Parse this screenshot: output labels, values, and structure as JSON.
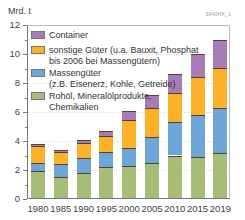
{
  "chart_data": {
    "type": "bar",
    "stacked": true,
    "title": "",
    "xlabel": "",
    "ylabel": "Mrd. t",
    "ylim": [
      0,
      12
    ],
    "yticks": [
      0,
      2,
      4,
      6,
      8,
      10,
      12
    ],
    "categories": [
      "1980",
      "1985",
      "1990",
      "1995",
      "2000",
      "2005",
      "2010",
      "2015",
      "2019"
    ],
    "series": [
      {
        "name": "Rohöl, Mineralölprodukte, Chemikalien",
        "color": "#a6bd78",
        "values": [
          1.9,
          1.5,
          1.8,
          2.2,
          2.25,
          2.5,
          3.0,
          2.9,
          3.15
        ]
      },
      {
        "name": "Massengüter (z.B. Eisenerz, Kohle, Getreide)",
        "color": "#6fa6d8",
        "values": [
          0.55,
          0.9,
          1.0,
          1.05,
          1.3,
          1.75,
          2.3,
          2.9,
          3.15
        ]
      },
      {
        "name": "sonstige Güter (u.a. Bauxit, Phosphat bis 2006 bei Massengütern)",
        "color": "#fbb22a",
        "values": [
          1.2,
          0.85,
          1.05,
          1.1,
          1.9,
          2.0,
          2.0,
          2.6,
          2.75
        ]
      },
      {
        "name": "Container",
        "color": "#a57bb8",
        "values": [
          0.15,
          0.12,
          0.22,
          0.37,
          0.6,
          0.92,
          1.3,
          1.6,
          1.95
        ]
      }
    ],
    "totals": [
      3.8,
      3.37,
      4.07,
      4.72,
      6.05,
      7.17,
      8.6,
      10.0,
      11.0
    ],
    "legend_position": "top-left inside",
    "grid": true
  },
  "header": {
    "unit": "Mrd. t",
    "code": "5940HX_1"
  },
  "legend": [
    {
      "label": "Container",
      "color": "#a57bb8"
    },
    {
      "label": "sonstige Güter (u.a. Bauxit, Phosphat\nbis 2006 bei Massengütern)",
      "color": "#fbb22a"
    },
    {
      "label": "Massengüter\n(z.B. Eisenerz, Kohle, Getreide)",
      "color": "#6fa6d8"
    },
    {
      "label": "Rohöl, Mineralölprodukte,\nChemikalien",
      "color": "#a6bd78"
    }
  ],
  "yaxis": {
    "labels": [
      "0",
      "2",
      "4",
      "6",
      "8",
      "10",
      "12"
    ]
  }
}
